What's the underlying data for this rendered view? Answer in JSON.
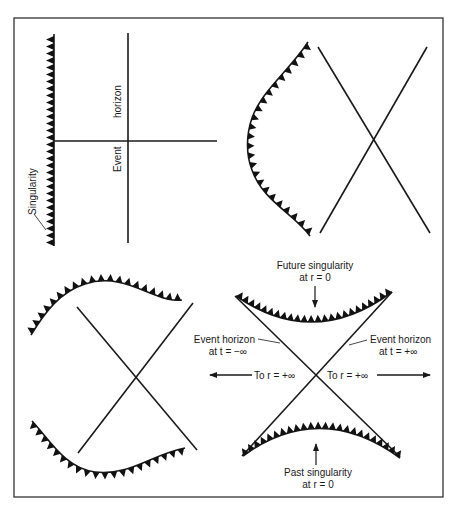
{
  "figure": {
    "frame": {
      "x": 14,
      "y": 18,
      "width": 429,
      "height": 479
    },
    "colors": {
      "ink": "#1a1a1a",
      "background": "#ffffff",
      "frame": "#333333"
    }
  },
  "panels": [
    {
      "id": "top-left",
      "description": "Schwarzschild coordinates: vertical singularity and event horizon",
      "labels": {
        "singularity": "Singularity",
        "event_word": "Event",
        "horizon_word": "horizon"
      }
    },
    {
      "id": "top-right",
      "description": "Curved singularity beside crossing event horizons"
    },
    {
      "id": "bottom-left",
      "description": "Wavy future and past singularities with crossing horizons"
    },
    {
      "id": "bottom-right",
      "description": "Kruskal diagram",
      "labels": {
        "future_singularity_line1": "Future singularity",
        "future_singularity_line2": "at r = 0",
        "past_singularity_line1": "Past singularity",
        "past_singularity_line2": "at r = 0",
        "horizon_left_line1": "Event horizon",
        "horizon_left_line2": "at t = −∞",
        "horizon_right_line1": "Event horizon",
        "horizon_right_line2": "at t = +∞",
        "to_infinity_left": "To r = +∞",
        "to_infinity_right": "To r = +∞"
      }
    }
  ]
}
